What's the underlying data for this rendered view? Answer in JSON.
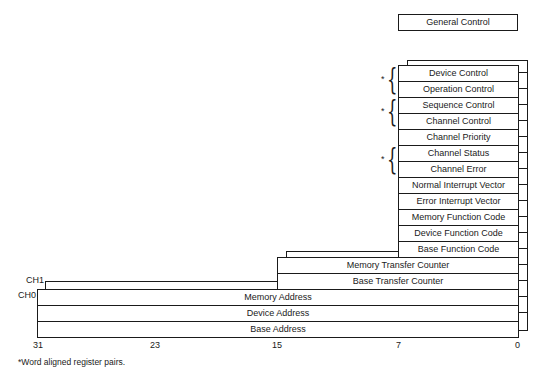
{
  "general_control": "General Control",
  "registers": [
    {
      "name": "Device Control"
    },
    {
      "name": "Operation Control"
    },
    {
      "name": "Sequence Control"
    },
    {
      "name": "Channel Control"
    },
    {
      "name": "Channel Priority"
    },
    {
      "name": "Channel Status"
    },
    {
      "name": "Channel Error"
    },
    {
      "name": "Normal Interrupt Vector"
    },
    {
      "name": "Error Interrupt Vector"
    },
    {
      "name": "Memory Function Code"
    },
    {
      "name": "Device Function Code"
    },
    {
      "name": "Base Function Code"
    },
    {
      "name": "Memory Transfer Counter"
    },
    {
      "name": "Base Transfer Counter"
    },
    {
      "name": "Memory Address"
    },
    {
      "name": "Device Address"
    },
    {
      "name": "Base Address"
    }
  ],
  "channels": {
    "ch1": "CH1",
    "ch0": "CH0"
  },
  "bit_labels": {
    "b31": "31",
    "b23": "23",
    "b15": "15",
    "b7": "7",
    "b0": "0"
  },
  "marker": "*",
  "footnote": "*Word aligned register pairs."
}
